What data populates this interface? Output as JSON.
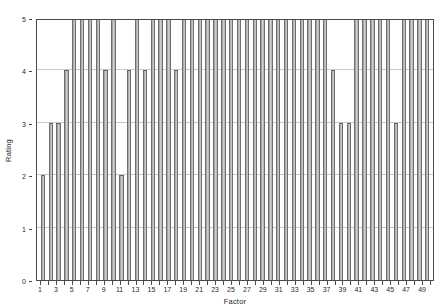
{
  "chart_data": {
    "type": "bar",
    "title": "",
    "xlabel": "Factor",
    "ylabel": "Rating",
    "ylim": [
      0,
      5
    ],
    "xlim": [
      0.5,
      50.5
    ],
    "grid": true,
    "legend_position": "none",
    "y_ticks": [
      0,
      1,
      2,
      3,
      4,
      5
    ],
    "y_tick_labels": [
      "0",
      "1",
      "2",
      "3",
      "4",
      "5"
    ],
    "x_ticks": [
      1,
      3,
      5,
      7,
      9,
      11,
      13,
      15,
      17,
      19,
      21,
      23,
      25,
      27,
      29,
      31,
      33,
      35,
      37,
      39,
      41,
      43,
      45,
      47,
      49
    ],
    "x_tick_labels": [
      "1",
      "3",
      "5",
      "7",
      "9",
      "11",
      "13",
      "15",
      "17",
      "19",
      "21",
      "23",
      "25",
      "27",
      "29",
      "31",
      "33",
      "35",
      "37",
      "39",
      "41",
      "43",
      "45",
      "47",
      "49"
    ],
    "categories": [
      1,
      2,
      3,
      4,
      5,
      6,
      7,
      8,
      9,
      10,
      11,
      12,
      13,
      14,
      15,
      16,
      17,
      18,
      19,
      20,
      21,
      22,
      23,
      24,
      25,
      26,
      27,
      28,
      29,
      30,
      31,
      32,
      33,
      34,
      35,
      36,
      37,
      38,
      39,
      40,
      41,
      42,
      43,
      44,
      45,
      46,
      47,
      48,
      49,
      50
    ],
    "values": [
      2,
      3,
      3,
      4,
      5,
      5,
      5,
      5,
      4,
      5,
      2,
      4,
      5,
      4,
      5,
      5,
      5,
      4,
      5,
      5,
      5,
      5,
      5,
      5,
      5,
      5,
      5,
      5,
      5,
      5,
      5,
      5,
      5,
      5,
      5,
      5,
      5,
      4,
      3,
      3,
      5,
      5,
      5,
      5,
      5,
      3,
      5,
      5,
      5,
      5
    ],
    "bar_fill_color": "#bdbdbd",
    "bar_edge_color": "#6e6e6e",
    "grid_color": "#c9c9c9",
    "axis_color": "#4a4a4a",
    "background_color": "#ffffff"
  }
}
